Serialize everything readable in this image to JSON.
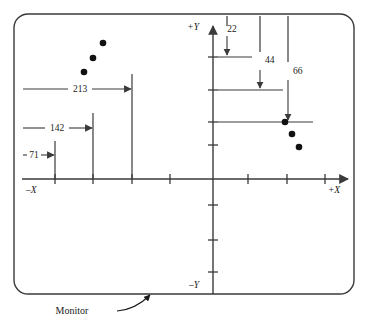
{
  "figure": {
    "caption": "Monitor",
    "monitor_frame": {
      "x": 14,
      "y": 14,
      "width": 340,
      "height": 280,
      "corner_radius": 14,
      "stroke": "#3a3a3a",
      "stroke_width": 1.4
    }
  },
  "axes": {
    "origin": {
      "x": 213,
      "y": 179
    },
    "x_axis": {
      "label_negative": "–X",
      "label_positive": "+X",
      "x_start": 22,
      "x_end": 352,
      "neg_label_pos": {
        "x": 26,
        "y": 193
      },
      "pos_label_pos": {
        "x": 334,
        "y": 193
      },
      "ticks_negative": [
        55,
        93,
        132,
        170
      ],
      "ticks_positive": [
        248,
        287,
        325
      ],
      "tick_half_length": 5
    },
    "y_axis": {
      "label_positive": "+Y",
      "label_negative": "–Y",
      "y_top": 22,
      "y_bottom": 294,
      "pos_label_pos": {
        "x": 190,
        "y": 30
      },
      "neg_label_pos": {
        "x": 190,
        "y": 288
      },
      "ticks_above": [
        57,
        90,
        122,
        145
      ],
      "ticks_below": [
        205,
        240,
        272
      ],
      "tick_half_length": 5
    },
    "stroke": "#3a3a3a",
    "stroke_width": 1.4
  },
  "x_dimensions": {
    "description": "Horizontal dimension lines measured leftward from origin along -X",
    "extension_line_x_origin": 22,
    "items": [
      {
        "label": "213",
        "value": 213,
        "tick_x": 132,
        "extension_top_y": 74,
        "dim_line_y": 89,
        "label_x": 79,
        "label_y": 92
      },
      {
        "label": "142",
        "value": 142,
        "tick_x": 93,
        "extension_top_y": 113,
        "dim_line_y": 128,
        "label_x": 57,
        "label_y": 131
      },
      {
        "label": "71",
        "value": 71,
        "tick_x": 55,
        "extension_top_y": 141,
        "dim_line_y": 155,
        "label_x": 31,
        "label_y": 158
      }
    ]
  },
  "y_dimensions": {
    "description": "Vertical dimension arrows measured downward from monitor top along +Y side",
    "extension_line_y_origin": 16,
    "items": [
      {
        "label": "22",
        "value": 22,
        "arrow_x": 227,
        "arrow_tip_y": 57,
        "h_line_y": 57,
        "h_line_x_start": 218,
        "h_line_x_end": 252,
        "label_x": 231,
        "label_y": 31
      },
      {
        "label": "44",
        "value": 44,
        "arrow_x": 260,
        "arrow_tip_y": 90,
        "h_line_y": 90,
        "h_line_x_start": 218,
        "h_line_x_end": 283,
        "label_x": 264,
        "label_y": 62
      },
      {
        "label": "66",
        "value": 66,
        "arrow_x": 288,
        "arrow_tip_y": 122,
        "h_line_y": 122,
        "h_line_x_start": 218,
        "h_line_x_end": 313,
        "label_x": 292,
        "label_y": 73
      }
    ]
  },
  "data_points": {
    "radius": 3.3,
    "fill": "#111111",
    "left_group": [
      {
        "x": 103,
        "y": 43
      },
      {
        "x": 93,
        "y": 58
      },
      {
        "x": 84,
        "y": 72
      }
    ],
    "right_group": [
      {
        "x": 285,
        "y": 122
      },
      {
        "x": 292,
        "y": 134
      },
      {
        "x": 299,
        "y": 147
      }
    ]
  },
  "callout": {
    "label": "Monitor",
    "label_x": 72,
    "label_y": 314,
    "leader_path": "M 117 311 C 131 310 142 303 150 295",
    "arrow_tip": {
      "x": 152,
      "y": 293
    }
  },
  "colors": {
    "ink": "#1a1a1a",
    "line": "#3a3a3a",
    "dot": "#111111",
    "background": "#ffffff"
  }
}
